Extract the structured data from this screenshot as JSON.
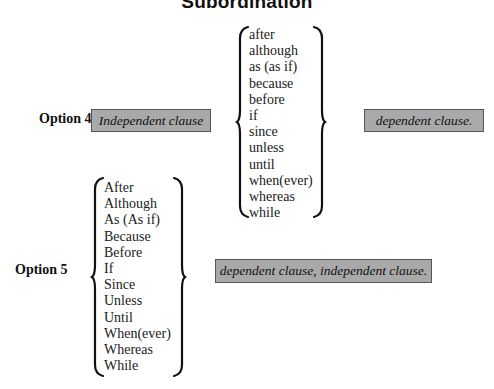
{
  "title": "Subordination",
  "option4": {
    "label": "Option 4",
    "independent_clause": "Independent clause",
    "conjunctions": [
      "after",
      "although",
      "as (as if)",
      "because",
      "before",
      "if",
      "since",
      "unless",
      "until",
      "when(ever)",
      "whereas",
      "while"
    ],
    "dependent_clause": "dependent clause."
  },
  "option5": {
    "label": "Option 5",
    "conjunctions": [
      "After",
      "Although",
      "As (As if)",
      "Because",
      "Before",
      "If",
      "Since",
      "Unless",
      "Until",
      "When(ever)",
      "Whereas",
      "While"
    ],
    "clause": "dependent clause, independent clause."
  },
  "colors": {
    "box_fill": "#a9a9a9",
    "box_border": "#555555",
    "text": "#111111"
  }
}
